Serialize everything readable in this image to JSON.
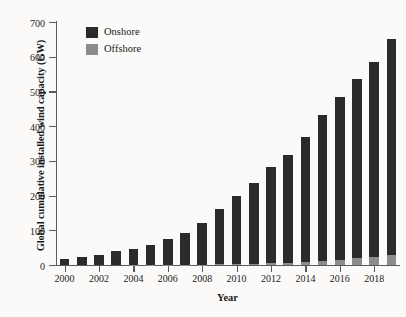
{
  "chart_data": {
    "type": "bar",
    "subtype": "stacked-bar",
    "title": "",
    "xlabel": "Year",
    "ylabel": "Global cumulative installed wind capacity (GW)",
    "categories": [
      "2000",
      "2001",
      "2002",
      "2003",
      "2004",
      "2005",
      "2006",
      "2007",
      "2008",
      "2009",
      "2010",
      "2011",
      "2012",
      "2013",
      "2014",
      "2015",
      "2016",
      "2017",
      "2018",
      "2019"
    ],
    "x_tick_labels": [
      "2000",
      "2002",
      "2004",
      "2006",
      "2008",
      "2010",
      "2012",
      "2014",
      "2016",
      "2018"
    ],
    "y_tick_labels": [
      "0",
      "100",
      "200",
      "300",
      "400",
      "500",
      "600",
      "700"
    ],
    "ylim": [
      0,
      700
    ],
    "ytick_step": 100,
    "grid": false,
    "legend_position": "top-left",
    "series": [
      {
        "name": "Offshore",
        "color": "#8c8c8c",
        "values": [
          0,
          0,
          0,
          0,
          1,
          1,
          1,
          1,
          1,
          2,
          3,
          4,
          5,
          7,
          9,
          12,
          14,
          19,
          23,
          29
        ]
      },
      {
        "name": "Onshore",
        "color": "#2b2b2b",
        "values": [
          17,
          23,
          30,
          39,
          46,
          58,
          73,
          92,
          120,
          158,
          195,
          233,
          277,
          309,
          361,
          420,
          470,
          516,
          561,
          622
        ]
      }
    ],
    "totals": [
      17,
      23,
      30,
      39,
      47,
      59,
      74,
      93,
      121,
      160,
      198,
      237,
      282,
      316,
      370,
      432,
      484,
      535,
      584,
      651
    ]
  },
  "legend": {
    "items": [
      {
        "label": "Onshore",
        "color": "#2b2b2b"
      },
      {
        "label": "Offshore",
        "color": "#8c8c8c"
      }
    ]
  },
  "colors": {
    "onshore": "#2b2b2b",
    "offshore": "#8c8c8c",
    "axis": "#5a5a5a",
    "text": "#1a1a1a",
    "background": "#fbfaf8"
  }
}
